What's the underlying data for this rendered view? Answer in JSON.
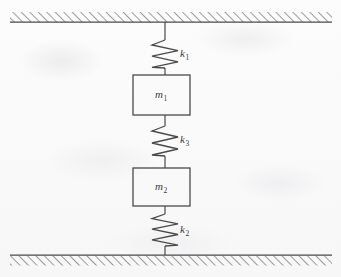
{
  "figure": {
    "kind": "mechanical-schematic",
    "width": 341,
    "height": 277,
    "background_color": "#fbfbfb",
    "line_color": "#4a4a4a"
  },
  "supports": {
    "ceiling": {
      "name": "fixed ceiling support",
      "hatch_side": "above",
      "x_start": 10,
      "x_end": 332,
      "line_y": 22,
      "hatch_height": 10
    },
    "floor": {
      "name": "fixed floor support",
      "hatch_side": "below",
      "x_start": 10,
      "x_end": 332,
      "line_y": 255,
      "hatch_height": 10
    }
  },
  "springs": [
    {
      "id": "k1",
      "label": "k",
      "subscript": "1",
      "coils": 5,
      "top_y": 22,
      "bottom_y": 75,
      "coil_top_y": 40,
      "coil_bottom_y": 68,
      "label_x": 180,
      "label_y": 48,
      "connects": [
        "ceiling",
        "m1"
      ]
    },
    {
      "id": "k3",
      "label": "k",
      "subscript": "3",
      "coils": 5,
      "top_y": 115,
      "bottom_y": 168,
      "coil_top_y": 126,
      "coil_bottom_y": 156,
      "label_x": 180,
      "label_y": 134,
      "connects": [
        "m1",
        "m2"
      ]
    },
    {
      "id": "k2",
      "label": "k",
      "subscript": "2",
      "coils": 6,
      "top_y": 205,
      "bottom_y": 255,
      "coil_top_y": 214,
      "coil_bottom_y": 246,
      "label_x": 180,
      "label_y": 224,
      "connects": [
        "m2",
        "floor"
      ]
    }
  ],
  "masses": [
    {
      "id": "m1",
      "label": "m",
      "subscript": "1",
      "x": 133,
      "y": 75,
      "width": 57,
      "height": 40,
      "label_x": 155,
      "label_y": 89
    },
    {
      "id": "m2",
      "label": "m",
      "subscript": "2",
      "x": 133,
      "y": 168,
      "width": 57,
      "height": 38,
      "label_x": 155,
      "label_y": 181
    }
  ],
  "center_axis_x": 165
}
